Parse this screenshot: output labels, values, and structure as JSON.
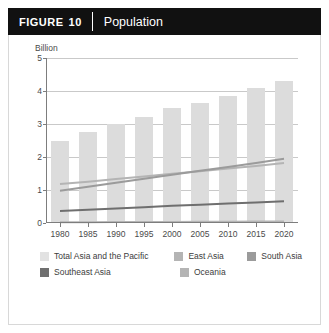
{
  "header": {
    "tag_label": "FIGURE",
    "tag_number": "10",
    "title": "Population"
  },
  "colors": {
    "header_bg": "#111111",
    "header_text": "#ffffff",
    "bar": "#dcdcdc",
    "total_asia": "#e2e2e2",
    "east_asia": "#b4b4b4",
    "south_asia": "#9b9b9b",
    "southeast_asia": "#6f6f6f",
    "oceania": "#b4b4b4",
    "gridline": "#c9c9c9",
    "axis": "#7d7d7d",
    "tick_text": "#4a4a4a"
  },
  "chart_data": {
    "type": "bar",
    "title": "Population",
    "xlabel": "",
    "ylabel": "Billion",
    "ylim": [
      0,
      5
    ],
    "yticks": [
      0,
      1,
      2,
      3,
      4,
      5
    ],
    "ytick_labels": [
      "0",
      "1",
      "2",
      "3",
      "4",
      "5"
    ],
    "grid": true,
    "legend_position": "bottom",
    "categories": [
      "1980",
      "1985",
      "1990",
      "1995",
      "2000",
      "2005",
      "2010",
      "2015",
      "2020"
    ],
    "series": [
      {
        "name": "Total Asia and the Pacific",
        "type": "bar",
        "color": "#dcdcdc",
        "values": [
          2.5,
          2.75,
          3.0,
          3.2,
          3.5,
          3.65,
          3.85,
          4.1,
          4.3
        ]
      },
      {
        "name": "East Asia",
        "type": "line",
        "color": "#b4b4b4",
        "values": [
          1.18,
          1.25,
          1.33,
          1.41,
          1.49,
          1.57,
          1.65,
          1.73,
          1.82
        ]
      },
      {
        "name": "South Asia",
        "type": "line",
        "color": "#9b9b9b",
        "values": [
          0.98,
          1.1,
          1.22,
          1.34,
          1.46,
          1.58,
          1.7,
          1.82,
          1.95
        ]
      },
      {
        "name": "Southeast Asia",
        "type": "line",
        "color": "#6f6f6f",
        "values": [
          0.36,
          0.4,
          0.44,
          0.48,
          0.52,
          0.55,
          0.59,
          0.62,
          0.66
        ]
      },
      {
        "name": "Oceania",
        "type": "line",
        "color": "#b4b4b4",
        "values": [
          0.023,
          0.026,
          0.028,
          0.031,
          0.033,
          0.036,
          0.039,
          0.042,
          0.044
        ]
      }
    ]
  },
  "legend": {
    "items": [
      {
        "label": "Total Asia and the Pacific",
        "color": "#e2e2e2"
      },
      {
        "label": "East Asia",
        "color": "#b4b4b4"
      },
      {
        "label": "South Asia",
        "color": "#9b9b9b"
      },
      {
        "label": "Southeast Asia",
        "color": "#6f6f6f"
      },
      {
        "label": "Oceania",
        "color": "#b4b4b4"
      }
    ]
  }
}
